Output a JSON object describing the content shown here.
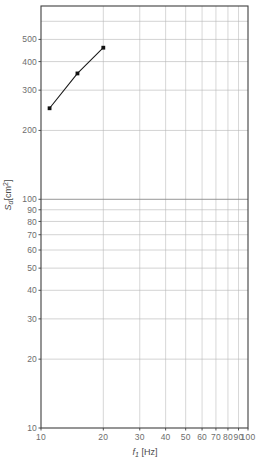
{
  "chart_data": {
    "type": "line",
    "title": "",
    "xlabel": "f1 [Hz]",
    "ylabel": "Sd [cm2]",
    "xscale": "log",
    "yscale": "log",
    "xlim": [
      10,
      100
    ],
    "ylim": [
      10,
      700
    ],
    "grid": true,
    "legend": null,
    "x_ticks": [
      10,
      20,
      30,
      40,
      50,
      60,
      70,
      80,
      90,
      100
    ],
    "x_tick_labels": [
      "10",
      "20",
      "30",
      "40",
      "50",
      "60",
      "70",
      "80",
      "90",
      "100"
    ],
    "y_ticks": [
      10,
      20,
      30,
      40,
      50,
      60,
      70,
      80,
      90,
      100,
      200,
      300,
      400,
      500
    ],
    "y_tick_labels": [
      "10",
      "20",
      "30",
      "40",
      "50",
      "60",
      "70",
      "80",
      "90",
      "100",
      "200",
      "300",
      "400",
      "500"
    ],
    "series": [
      {
        "name": "Sd",
        "marker": "square",
        "color": "#1a1a1a",
        "x": [
          11,
          15,
          20
        ],
        "y": [
          250,
          355,
          460
        ]
      }
    ]
  },
  "axes": {
    "x_title_main": "f",
    "x_title_sub": "1",
    "x_title_unit": "[Hz]",
    "y_title_main": "S",
    "y_title_sub": "d",
    "y_title_unit": "[cm",
    "y_title_sup": "2",
    "y_title_unit_close": "]"
  },
  "colors": {
    "frame": "#3f3f3f",
    "major_grid": "#8a8a8a",
    "minor_grid": "#b5b5b5",
    "data_line": "#1a1a1a",
    "marker": "#111111",
    "tick_text": "#6d6d6d",
    "title_text": "#4a4a4a",
    "background": "#ffffff"
  }
}
